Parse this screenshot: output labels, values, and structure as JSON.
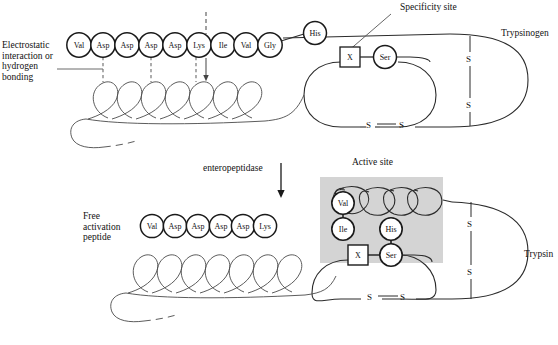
{
  "figure": {
    "title_top_right": "Trypsinogen",
    "title_bottom_right": "Trypsin",
    "specificity_label": "Specificity site",
    "active_site_label": "Active site",
    "enzyme_label": "enteropeptidase",
    "electrostatic_label": "Electrostatic\ninteraction or\nhydrogen\nbonding",
    "free_peptide_label": "Free\nactivation\npeptide"
  },
  "colors": {
    "stroke": "#1a1a1a",
    "thin_stroke": "#3a3a3a",
    "active_site_fill": "#d4d4d4",
    "background": "#ffffff",
    "text": "#111111"
  },
  "trypsinogen": {
    "n_terminal_residues": [
      {
        "label": "Val",
        "cx": 79,
        "cy": 45
      },
      {
        "label": "Asp",
        "cx": 103,
        "cy": 45
      },
      {
        "label": "Asp",
        "cx": 127,
        "cy": 45
      },
      {
        "label": "Asp",
        "cx": 151,
        "cy": 45
      },
      {
        "label": "Asp",
        "cx": 175,
        "cy": 45
      },
      {
        "label": "Lys",
        "cx": 199,
        "cy": 45
      },
      {
        "label": "Ile",
        "cx": 223,
        "cy": 45
      },
      {
        "label": "Val",
        "cx": 246,
        "cy": 45
      },
      {
        "label": "Gly",
        "cx": 270,
        "cy": 45
      }
    ],
    "catalytic_residues": [
      {
        "label": "His",
        "cx": 315,
        "cy": 33
      },
      {
        "label": "Ser",
        "cx": 385,
        "cy": 57
      }
    ],
    "specificity_box": {
      "label": "X",
      "cx": 350,
      "cy": 57
    },
    "disulfide_upper": {
      "label": "S",
      "x": 468,
      "y": 59
    },
    "disulfide_lower": {
      "label": "S",
      "x": 468,
      "y": 105
    },
    "loop_disulfide_left": {
      "label": "S",
      "x": 370,
      "y": 125
    },
    "loop_disulfide_right": {
      "label": "S",
      "x": 402,
      "y": 125
    },
    "cleavage_arrow_x": 198,
    "hbond_dash_positions": [
      103,
      151,
      199
    ],
    "loop_count": 7
  },
  "trypsin": {
    "free_peptide_residues": [
      {
        "label": "Val",
        "cx": 152,
        "cy": 226
      },
      {
        "label": "Asp",
        "cx": 175,
        "cy": 226
      },
      {
        "label": "Asp",
        "cx": 198,
        "cy": 226
      },
      {
        "label": "Asp",
        "cx": 221,
        "cy": 226
      },
      {
        "label": "Asp",
        "cx": 243,
        "cy": 226
      },
      {
        "label": "Lys",
        "cx": 264,
        "cy": 226
      }
    ],
    "active_site_residues": [
      {
        "label": "Val",
        "cx": 343,
        "cy": 203
      },
      {
        "label": "Ile",
        "cx": 343,
        "cy": 228
      },
      {
        "label": "His",
        "cx": 391,
        "cy": 228
      },
      {
        "label": "Ser",
        "cx": 391,
        "cy": 255
      }
    ],
    "specificity_box": {
      "label": "X",
      "cx": 358,
      "cy": 255
    },
    "active_site_rect": {
      "x": 320,
      "y": 177,
      "width": 123,
      "height": 86
    },
    "disulfide_upper": {
      "label": "S",
      "x": 470,
      "y": 224
    },
    "disulfide_lower": {
      "label": "S",
      "x": 470,
      "y": 272
    },
    "loop_disulfide_left": {
      "label": "S",
      "x": 371,
      "y": 296
    },
    "loop_disulfide_right": {
      "label": "S",
      "x": 404,
      "y": 296
    },
    "loop_count": 7
  }
}
